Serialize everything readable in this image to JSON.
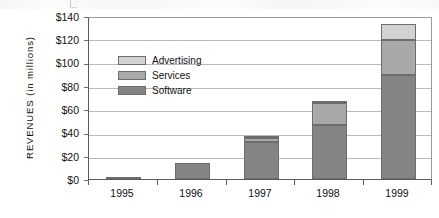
{
  "chart_data": {
    "type": "bar",
    "stacked": true,
    "title": "",
    "subtitle": "",
    "xlabel": "",
    "ylabel": "REVENUES  (in millions)",
    "categories": [
      "1995",
      "1996",
      "1997",
      "1998",
      "1999"
    ],
    "series": [
      {
        "name": "Software",
        "color": "#848484",
        "values": [
          1.5,
          13.5,
          32,
          46,
          89
        ]
      },
      {
        "name": "Services",
        "color": "#a8a8a8",
        "values": [
          0,
          0,
          3,
          19,
          30
        ]
      },
      {
        "name": "Advertising",
        "color": "#d2d2d2",
        "values": [
          0,
          0,
          2,
          1,
          14
        ]
      }
    ],
    "totals": [
      1.5,
      13.5,
      37,
      66,
      133
    ],
    "ylim": [
      0,
      140
    ],
    "ytick_step": 20,
    "ytick_labels": [
      "$140",
      "$120",
      "$100",
      "$80",
      "$60",
      "$40",
      "$20",
      "$0"
    ],
    "ytick_values": [
      140,
      120,
      100,
      80,
      60,
      40,
      20,
      0
    ],
    "grid": true,
    "grid_axis": "y",
    "legend_position": "inside-upper-left",
    "legend": [
      {
        "label": "Advertising",
        "color": "#d2d2d2"
      },
      {
        "label": "Services",
        "color": "#a8a8a8"
      },
      {
        "label": "Software",
        "color": "#848484"
      }
    ]
  }
}
